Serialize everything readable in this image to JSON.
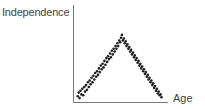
{
  "chart_data": {
    "type": "scatter",
    "title": "",
    "xlabel": "Age",
    "ylabel": "Independence",
    "grid": false,
    "legend": null,
    "ticks": {
      "x": [],
      "y": []
    },
    "shape": "inverted-V: independence rises with age to a peak near mid-range, then declines symmetrically",
    "xlim": [
      0,
      100
    ],
    "ylim": [
      0,
      100
    ],
    "peak": {
      "x": 49,
      "y": 70
    },
    "colors": {
      "points": "#1e1e1e",
      "axes": "#7a7a7a",
      "labels": "#444444"
    },
    "series": [
      {
        "name": "observations",
        "points": [
          [
            3,
            4
          ],
          [
            4,
            8
          ],
          [
            5,
            2
          ],
          [
            6,
            10
          ],
          [
            7,
            6
          ],
          [
            8,
            12
          ],
          [
            9,
            5
          ],
          [
            10,
            14
          ],
          [
            11,
            9
          ],
          [
            12,
            16
          ],
          [
            13,
            11
          ],
          [
            14,
            19
          ],
          [
            15,
            14
          ],
          [
            16,
            21
          ],
          [
            17,
            17
          ],
          [
            18,
            24
          ],
          [
            19,
            19
          ],
          [
            20,
            26
          ],
          [
            21,
            22
          ],
          [
            22,
            29
          ],
          [
            23,
            25
          ],
          [
            24,
            31
          ],
          [
            25,
            27
          ],
          [
            26,
            34
          ],
          [
            27,
            30
          ],
          [
            28,
            37
          ],
          [
            29,
            33
          ],
          [
            30,
            39
          ],
          [
            31,
            35
          ],
          [
            32,
            42
          ],
          [
            33,
            38
          ],
          [
            34,
            45
          ],
          [
            35,
            41
          ],
          [
            36,
            47
          ],
          [
            37,
            44
          ],
          [
            38,
            50
          ],
          [
            39,
            46
          ],
          [
            40,
            53
          ],
          [
            41,
            49
          ],
          [
            42,
            55
          ],
          [
            43,
            52
          ],
          [
            44,
            58
          ],
          [
            45,
            55
          ],
          [
            46,
            61
          ],
          [
            47,
            58
          ],
          [
            48,
            64
          ],
          [
            49,
            62
          ],
          [
            50,
            67
          ],
          [
            51,
            70
          ],
          [
            52,
            64
          ],
          [
            53,
            66
          ],
          [
            54,
            61
          ],
          [
            55,
            63
          ],
          [
            56,
            58
          ],
          [
            57,
            60
          ],
          [
            58,
            55
          ],
          [
            59,
            57
          ],
          [
            60,
            52
          ],
          [
            61,
            54
          ],
          [
            62,
            49
          ],
          [
            63,
            51
          ],
          [
            64,
            46
          ],
          [
            65,
            48
          ],
          [
            66,
            43
          ],
          [
            67,
            45
          ],
          [
            68,
            40
          ],
          [
            69,
            42
          ],
          [
            70,
            37
          ],
          [
            71,
            39
          ],
          [
            72,
            34
          ],
          [
            73,
            36
          ],
          [
            74,
            31
          ],
          [
            75,
            33
          ],
          [
            76,
            28
          ],
          [
            77,
            30
          ],
          [
            78,
            25
          ],
          [
            79,
            27
          ],
          [
            80,
            22
          ],
          [
            81,
            24
          ],
          [
            82,
            19
          ],
          [
            83,
            21
          ],
          [
            84,
            16
          ],
          [
            85,
            18
          ],
          [
            86,
            13
          ],
          [
            87,
            15
          ],
          [
            88,
            10
          ],
          [
            89,
            12
          ],
          [
            90,
            7
          ],
          [
            91,
            9
          ],
          [
            92,
            5
          ],
          [
            93,
            6
          ],
          [
            94,
            3
          ]
        ]
      }
    ]
  },
  "labels": {
    "y_axis": "Independence",
    "x_axis": "Age"
  }
}
